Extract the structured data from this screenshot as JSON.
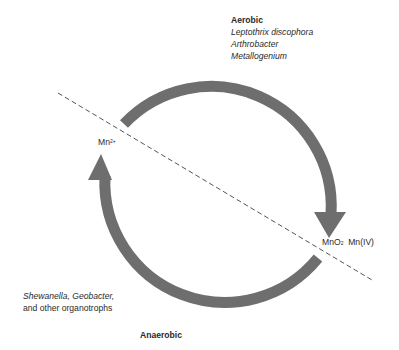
{
  "aerobic": {
    "heading": "Aerobic",
    "organisms": [
      "Leptothrix discophora",
      "Arthrobacter",
      "Metallogenium"
    ]
  },
  "anaerobic": {
    "heading": "Anaerobic",
    "organisms_line1": "Shewanella, Geobacter,",
    "organisms_line2": "and other organotrophs"
  },
  "species": {
    "reduced": {
      "symbol": "Mn",
      "charge": "2+"
    },
    "oxidized": {
      "formula": "MnO",
      "subscript": "2",
      "state": "Mn(IV)"
    }
  },
  "colors": {
    "arrow": "#6e6e6e",
    "divider": "#555555",
    "text": "#2a2a2a"
  }
}
